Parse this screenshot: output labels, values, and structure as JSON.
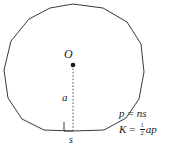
{
  "figure": {
    "name": "regular-polygon-apothem-diagram",
    "background_color": "#ffffff",
    "stroke_color": "#3a3a3a",
    "text_color": "#1a1a1a",
    "center_label": "O",
    "apothem_label": "a",
    "side_label": "s",
    "center_point": {
      "x": 73,
      "y": 65
    },
    "apothem_line": {
      "x": 73,
      "y_top": 65,
      "y_bottom": 131
    },
    "right_angle_marker": {
      "x": 64,
      "y": 122,
      "size": 9
    },
    "polygon_sides": 14,
    "polygon_points": "73,4 103,8 127,22 141,44 144,72 139,99 126,118 104,130 73,131 44,130 22,119 8,98 4,70 11,41 29,19 50,8"
  },
  "formulas": {
    "perimeter": {
      "lhs": "p",
      "eq": "=",
      "rhs": "ns"
    },
    "area": {
      "lhs": "K",
      "eq": "=",
      "fraction_numerator": "1",
      "fraction_denominator": "2",
      "rhs": "ap"
    }
  }
}
